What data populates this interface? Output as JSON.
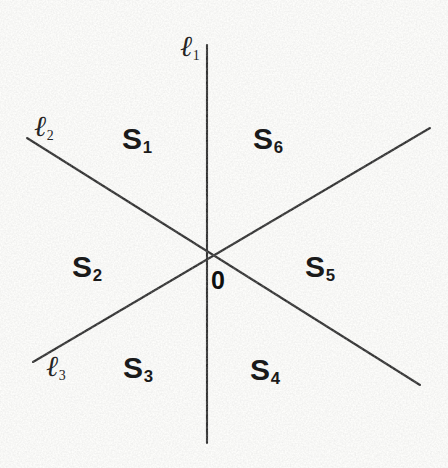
{
  "figure": {
    "canvas": {
      "width": 448,
      "height": 468
    },
    "background_color": "#fdfdfb",
    "stroke_color": "#2b2b2b",
    "text_color": "#1a1a1a",
    "origin": {
      "x": 207,
      "y": 256,
      "label": "0"
    },
    "lines": [
      {
        "id": "l1",
        "label": "ℓ",
        "subscript": "1",
        "label_x": 180,
        "label_y": 32,
        "x1": 207,
        "y1": 45,
        "x2": 207,
        "y2": 443,
        "orientation": "vertical"
      },
      {
        "id": "l2",
        "label": "ℓ",
        "subscript": "2",
        "label_x": 34,
        "label_y": 112,
        "x1": 27,
        "y1": 138,
        "x2": 420,
        "y2": 385,
        "orientation": "descending"
      },
      {
        "id": "l3",
        "label": "ℓ",
        "subscript": "3",
        "label_x": 46,
        "label_y": 352,
        "x1": 33,
        "y1": 362,
        "x2": 430,
        "y2": 128,
        "orientation": "ascending"
      }
    ],
    "sectors": [
      {
        "id": "S1",
        "label": "S",
        "subscript": "1",
        "x": 122,
        "y": 124,
        "position": "top-left"
      },
      {
        "id": "S6",
        "label": "S",
        "subscript": "6",
        "x": 253,
        "y": 124,
        "position": "top-right"
      },
      {
        "id": "S2",
        "label": "S",
        "subscript": "2",
        "x": 72,
        "y": 252,
        "position": "left"
      },
      {
        "id": "S5",
        "label": "S",
        "subscript": "5",
        "x": 305,
        "y": 252,
        "position": "right"
      },
      {
        "id": "S3",
        "label": "S",
        "subscript": "3",
        "x": 123,
        "y": 353,
        "position": "bottom-left"
      },
      {
        "id": "S4",
        "label": "S",
        "subscript": "4",
        "x": 250,
        "y": 355,
        "position": "bottom-right"
      }
    ],
    "origin_label": {
      "text": "0",
      "x": 211,
      "y": 268
    }
  }
}
